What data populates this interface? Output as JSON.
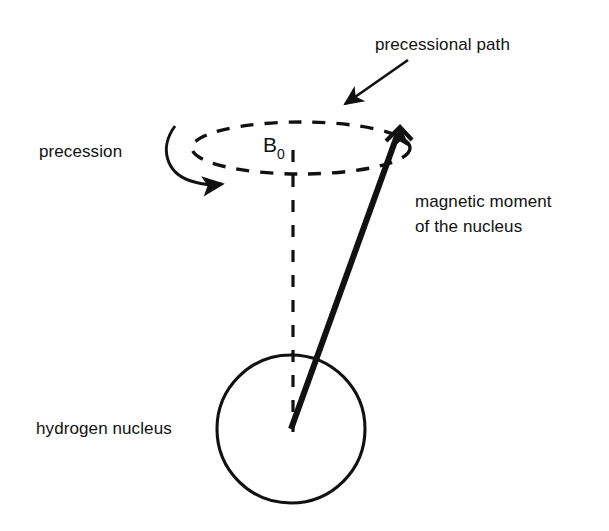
{
  "diagram": {
    "background_color": "#ffffff",
    "ink_color": "#111111",
    "labels": {
      "precessional_path": "precessional path",
      "precession": "precession",
      "field_symbol": "B",
      "field_subscript": "0",
      "magnetic_moment_line1": "magnetic moment",
      "magnetic_moment_line2": "of the nucleus",
      "hydrogen_nucleus": "hydrogen nucleus"
    },
    "geometry": {
      "nucleus_center_x": 291,
      "nucleus_center_y": 429,
      "nucleus_radius": 74,
      "ellipse_center_x": 301,
      "ellipse_center_y": 148,
      "ellipse_radius_x": 109,
      "ellipse_radius_y": 26,
      "axis_top_y": 150,
      "axis_bottom_y": 429,
      "moment_tip_x": 400,
      "moment_tip_y": 128
    }
  }
}
